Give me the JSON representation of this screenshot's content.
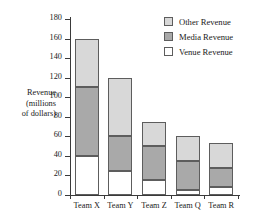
{
  "chart_data": {
    "type": "bar",
    "subtype": "stacked-bar",
    "title": "",
    "xlabel": "",
    "ylabel": "Revenue (millions of dollars)",
    "ylabel_lines": [
      "Revenue",
      "(millions",
      "of dollars)"
    ],
    "categories": [
      "Team X",
      "Team Y",
      "Team Z",
      "Team Q",
      "Team R"
    ],
    "series": [
      {
        "name": "Venue Revenue",
        "color": "#ffffff",
        "values": [
          40,
          25,
          15,
          5,
          8
        ]
      },
      {
        "name": "Media Revenue",
        "color": "#a9a9a9",
        "values": [
          70,
          35,
          35,
          30,
          20
        ]
      },
      {
        "name": "Other Revenue",
        "color": "#d8d8d8",
        "values": [
          50,
          60,
          25,
          25,
          25
        ]
      }
    ],
    "stack_order_bottom_to_top": [
      "Venue Revenue",
      "Media Revenue",
      "Other Revenue"
    ],
    "totals": [
      160,
      120,
      75,
      60,
      53
    ],
    "ylim": [
      0,
      180
    ],
    "ytick_step": 20,
    "yticks": [
      0,
      20,
      40,
      60,
      80,
      100,
      120,
      140,
      160,
      180
    ],
    "ytick_labels": [
      "0",
      "20",
      "40",
      "60",
      "80",
      "100",
      "120",
      "140",
      "160",
      "180"
    ],
    "grid": false,
    "legend_position": "top-right",
    "legend_entries": [
      {
        "label": "Other Revenue",
        "color": "#d8d8d8"
      },
      {
        "label": "Media Revenue",
        "color": "#a9a9a9"
      },
      {
        "label": "Venue Revenue",
        "color": "#ffffff"
      }
    ]
  },
  "colors": {
    "other_revenue": "#d8d8d8",
    "media_revenue": "#a9a9a9",
    "venue_revenue": "#ffffff",
    "axis": "#3a3a3a",
    "outline": "#5d5d5d",
    "text": "#1a1a1a",
    "background": "#ffffff"
  }
}
